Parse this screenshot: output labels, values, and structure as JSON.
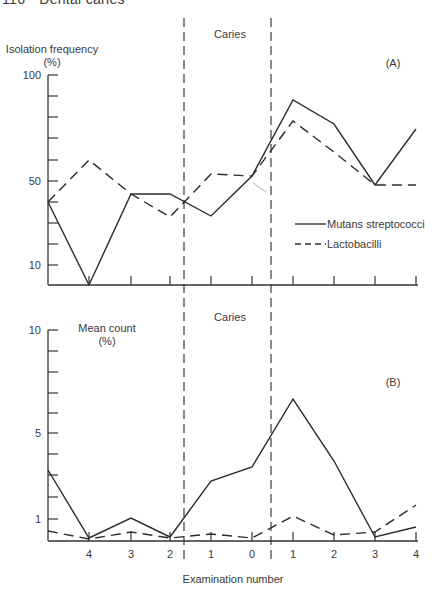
{
  "page": {
    "page_number": "116",
    "running_title": "Dental caries"
  },
  "colors": {
    "ink": "#2b2b2b",
    "axis": "#333333",
    "text": "#3a3a3a",
    "artifact": "#c8c8c8"
  },
  "layout": {
    "x_positions": [
      48,
      89,
      131,
      170,
      211,
      252,
      293,
      334,
      375,
      416
    ],
    "x_axis_end": 418,
    "caries_lines_x": [
      184,
      271
    ],
    "caries_lines_y": [
      18,
      560
    ]
  },
  "chart_data": [
    {
      "panel": "A",
      "type": "line",
      "title": "",
      "panel_label": "(A)",
      "ylabel_line1": "Isolation frequency",
      "ylabel_line2": "(%)",
      "xlabel": "Examination number",
      "annotation": "Caries",
      "x_tick_labels": [
        "",
        "4",
        "3",
        "2",
        "1",
        "0",
        "1",
        "2",
        "3",
        "4"
      ],
      "y_tick_labels": [
        {
          "label": "100",
          "value": 100
        },
        {
          "label": "50",
          "value": 50
        },
        {
          "label": "10",
          "value": 10
        }
      ],
      "ylim": [
        0,
        100
      ],
      "grid": false,
      "legend_position": "right-middle",
      "categories": [
        "start",
        "4",
        "3",
        "2",
        "1",
        "0",
        "1",
        "2",
        "3",
        "4"
      ],
      "series": [
        {
          "name": "Mutans streptococci",
          "style": "solid",
          "values": [
            40,
            0,
            44,
            44,
            33,
            52,
            88,
            76,
            47,
            74
          ]
        },
        {
          "name": "Lactobacilli",
          "style": "dashed",
          "values": [
            40,
            60,
            44,
            33,
            53,
            52,
            78,
            64,
            47,
            47
          ]
        }
      ],
      "pixel": {
        "y_top": 75,
        "y_base": 285,
        "tick_ys": [
          75,
          96,
          117,
          138,
          160,
          181,
          202,
          223,
          244,
          265
        ],
        "label_ys": {
          "100": 75,
          "50": 181,
          "10": 265
        },
        "series_y": [
          [
            202,
            285,
            194,
            194,
            216,
            176,
            100,
            124,
            185,
            129
          ],
          [
            202,
            160,
            194,
            217,
            174,
            176,
            121,
            152,
            185,
            185
          ]
        ]
      }
    },
    {
      "panel": "B",
      "type": "line",
      "title": "",
      "panel_label": "(B)",
      "ylabel_line1": "Mean count",
      "ylabel_line2": "(%)",
      "xlabel": "Examination number",
      "annotation": "Caries",
      "x_tick_labels": [
        "",
        "4",
        "3",
        "2",
        "1",
        "0",
        "1",
        "2",
        "3",
        "4"
      ],
      "y_tick_labels": [
        {
          "label": "10",
          "value": 10
        },
        {
          "label": "5",
          "value": 5
        },
        {
          "label": "1",
          "value": 1
        }
      ],
      "ylim": [
        0,
        10
      ],
      "grid": false,
      "categories": [
        "start",
        "4",
        "3",
        "2",
        "1",
        "0",
        "1",
        "2",
        "3",
        "4"
      ],
      "series": [
        {
          "name": "Mutans streptococci",
          "style": "solid",
          "values": [
            3.3,
            0.2,
            1.1,
            0.2,
            2.8,
            3.4,
            6.6,
            3.7,
            0.2,
            0.7
          ]
        },
        {
          "name": "Lactobacilli",
          "style": "dashed",
          "values": [
            0.5,
            0.1,
            0.4,
            0.2,
            0.3,
            0.2,
            1.1,
            0.3,
            0.4,
            1.7
          ]
        }
      ],
      "pixel": {
        "y_top": 330,
        "y_base": 541,
        "tick_ys": [
          330,
          351,
          372,
          393,
          413,
          433,
          454,
          475,
          497,
          519
        ],
        "label_ys": {
          "10": 330,
          "5": 433,
          "1": 519
        },
        "series_y": [
          [
            470,
            538,
            518,
            537,
            481,
            467,
            399,
            461,
            537,
            527
          ],
          [
            531,
            539,
            532,
            538,
            534,
            538,
            516,
            535,
            532,
            505
          ]
        ]
      }
    }
  ],
  "legend": {
    "items": [
      {
        "label": "Mutans streptococci",
        "style": "solid"
      },
      {
        "label": "Lactobacilli",
        "style": "dashed"
      }
    ]
  },
  "labels": {
    "caries_top": "Caries",
    "caries_bottom": "Caries",
    "x_axis_title": "Examination number",
    "panel_a": "(A)",
    "panel_b": "(B)",
    "upper_ylabel_line1": "Isolation frequency",
    "upper_ylabel_line2": "(%)",
    "lower_ylabel_line1": "Mean count",
    "lower_ylabel_line2": "(%)"
  }
}
